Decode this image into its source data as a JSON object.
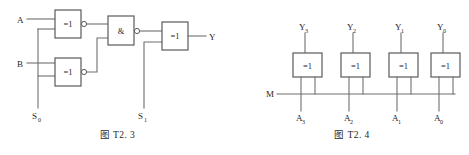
{
  "sheet": {
    "background_color": "#ffffff",
    "wire_color": "#6f6f6f",
    "gate_stroke_color": "#5a5a5a",
    "text_color": "#1f1f1f"
  },
  "figures": [
    {
      "id": "T2.3",
      "caption": "图 T2. 3",
      "description": "Controlled arithmetic logic circuit built from two XOR gates, one AND gate and one output XOR gate",
      "gates": [
        {
          "name": "xor-gate-top",
          "label": "=1",
          "inverted_output": true
        },
        {
          "name": "xor-gate-bottom",
          "label": "=1",
          "inverted_output": true
        },
        {
          "name": "and-gate",
          "label": "&",
          "inverted_output": true
        },
        {
          "name": "xor-gate-output",
          "label": "=1",
          "inverted_output": false
        }
      ],
      "inputs": [
        {
          "name": "input-a",
          "label": "A"
        },
        {
          "name": "input-b",
          "label": "B"
        },
        {
          "name": "input-s0",
          "label": "S",
          "subscript": "0"
        },
        {
          "name": "input-s1",
          "label": "S",
          "subscript": "1"
        }
      ],
      "outputs": [
        {
          "name": "output-y",
          "label": "Y"
        }
      ]
    },
    {
      "id": "T2.4",
      "caption": "图 T2. 4",
      "description": "Four XOR gates forming a controlled complementer driven by a common M control bus",
      "gates": [
        {
          "name": "xor-gate-3",
          "label": "=1"
        },
        {
          "name": "xor-gate-2",
          "label": "=1"
        },
        {
          "name": "xor-gate-1",
          "label": "=1"
        },
        {
          "name": "xor-gate-0",
          "label": "=1"
        }
      ],
      "outputs": [
        {
          "name": "output-y3",
          "label": "Y",
          "subscript": "3"
        },
        {
          "name": "output-y2",
          "label": "Y",
          "subscript": "2"
        },
        {
          "name": "output-y1",
          "label": "Y",
          "subscript": "1"
        },
        {
          "name": "output-y0",
          "label": "Y",
          "subscript": "0"
        }
      ],
      "inputs": [
        {
          "name": "input-m",
          "label": "M"
        },
        {
          "name": "input-a3",
          "label": "A",
          "subscript": "3"
        },
        {
          "name": "input-a2",
          "label": "A",
          "subscript": "2"
        },
        {
          "name": "input-a1",
          "label": "A",
          "subscript": "1"
        },
        {
          "name": "input-a0",
          "label": "A",
          "subscript": "0"
        }
      ]
    }
  ]
}
